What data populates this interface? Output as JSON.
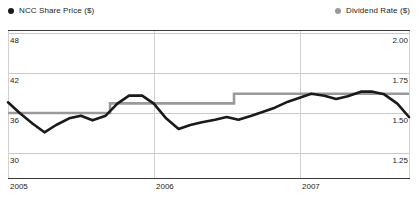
{
  "legend": {
    "series_a": {
      "label": "NCC Share Price ($)",
      "marker": "circle-marker-black",
      "color": "#1a1a1a"
    },
    "series_b": {
      "label": "Dividend Rate ($)",
      "marker": "circle-marker-gray",
      "color": "#9a9a9a"
    }
  },
  "axes": {
    "left": {
      "ticks": [
        "48",
        "42",
        "36",
        "30"
      ]
    },
    "right": {
      "ticks": [
        "2.00",
        "1.75",
        "1.50",
        "1.25"
      ]
    },
    "bottom": {
      "ticks": [
        "2005",
        "2006",
        "2007"
      ]
    }
  },
  "chart_data": {
    "type": "line",
    "title": "",
    "xlabel": "",
    "ylabel": "NCC Share Price ($)",
    "y2label": "Dividend Rate ($)",
    "grid": true,
    "legend_position": "top",
    "xlim": [
      2005.0,
      2007.75
    ],
    "ylim": [
      28,
      50
    ],
    "y2lim": [
      1.1667,
      2.0833
    ],
    "yticks": [
      48,
      42,
      36,
      30
    ],
    "y2ticks": [
      2.0,
      1.75,
      1.5,
      1.25
    ],
    "xticks": [
      2005,
      2006,
      2007
    ],
    "series": [
      {
        "name": "NCC Share Price ($)",
        "axis": "left",
        "color": "#1a1a1a",
        "x": [
          2005.0,
          2005.08,
          2005.17,
          2005.25,
          2005.33,
          2005.42,
          2005.5,
          2005.58,
          2005.67,
          2005.75,
          2005.83,
          2005.92,
          2006.0,
          2006.08,
          2006.17,
          2006.25,
          2006.33,
          2006.42,
          2006.5,
          2006.58,
          2006.67,
          2006.75,
          2006.83,
          2006.92,
          2007.0,
          2007.08,
          2007.17,
          2007.25,
          2007.33,
          2007.42,
          2007.5,
          2007.58,
          2007.67,
          2007.75
        ],
        "values": [
          37.6,
          36.0,
          34.4,
          33.1,
          34.2,
          35.2,
          35.6,
          34.9,
          35.6,
          37.4,
          38.6,
          38.6,
          37.4,
          35.3,
          33.6,
          34.2,
          34.6,
          35.0,
          35.4,
          35.0,
          35.6,
          36.2,
          36.8,
          37.7,
          38.3,
          38.9,
          38.6,
          38.1,
          38.5,
          39.2,
          39.2,
          38.8,
          37.4,
          35.4
        ]
      },
      {
        "name": "Dividend Rate ($)",
        "axis": "right",
        "color": "#9a9a9a",
        "step": "post",
        "x": [
          2005.0,
          2005.7,
          2006.55,
          2007.75
        ],
        "values": [
          1.5,
          1.56,
          1.62,
          1.62
        ]
      }
    ]
  }
}
